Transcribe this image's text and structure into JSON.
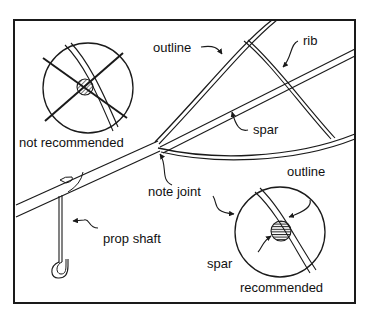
{
  "diagram": {
    "labels": {
      "outline_top": "outline",
      "rib": "rib",
      "spar_main": "spar",
      "not_recommended": "not recommended",
      "note_joint": "note joint",
      "prop_shaft": "prop shaft",
      "outline_detail": "outline",
      "spar_detail": "spar",
      "recommended": "recommended"
    },
    "colors": {
      "ink": "#1a1a1a",
      "background": "#ffffff"
    }
  }
}
